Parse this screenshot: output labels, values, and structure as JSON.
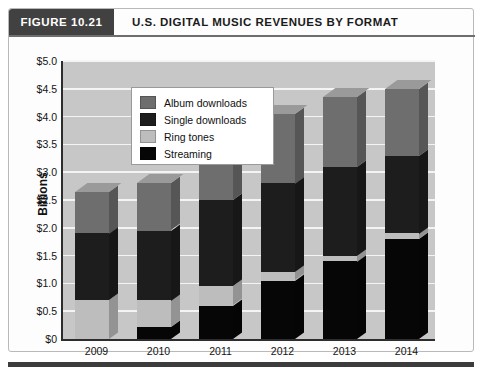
{
  "header": {
    "figure_tab": "FIGURE 10.21",
    "title": "U.S. DIGITAL MUSIC REVENUES BY FORMAT"
  },
  "footer": {
    "note": ""
  },
  "colors": {
    "album_downloads": "#6e6e6e",
    "single_downloads": "#1d1d1d",
    "ring_tones": "#bdbdbd",
    "streaming": "#060606",
    "plot_background": "#c7c7c7",
    "gridline": "#f4f4f4",
    "axis": "#2d2d2d",
    "tab_background": "#414141"
  },
  "chart_data": {
    "type": "bar",
    "subtype": "stacked-3d-column",
    "title": "U.S. DIGITAL MUSIC REVENUES BY FORMAT",
    "xlabel": "",
    "ylabel": "Billions",
    "ylim": [
      0,
      5.0
    ],
    "ytick_step": 0.5,
    "ytick_labels": [
      "$0",
      "$0.5",
      "$1.0",
      "$1.5",
      "$2.0",
      "$2.5",
      "$3.0",
      "$3.5",
      "$4.0",
      "$4.5",
      "$5.0"
    ],
    "ytick_values": [
      0,
      0.5,
      1.0,
      1.5,
      2.0,
      2.5,
      3.0,
      3.5,
      4.0,
      4.5,
      5.0
    ],
    "grid": true,
    "legend_position": "upper-left-inside",
    "categories": [
      "2009",
      "2010",
      "2011",
      "2012",
      "2013",
      "2014"
    ],
    "stack_order_bottom_to_top": [
      "Streaming",
      "Ring tones",
      "Single downloads",
      "Album downloads"
    ],
    "series": [
      {
        "name": "Streaming",
        "color": "#060606",
        "values": [
          0.0,
          0.22,
          0.6,
          1.05,
          1.4,
          1.8
        ]
      },
      {
        "name": "Ring tones",
        "color": "#bdbdbd",
        "values": [
          0.7,
          0.48,
          0.35,
          0.15,
          0.1,
          0.1
        ]
      },
      {
        "name": "Single downloads",
        "color": "#1d1d1d",
        "values": [
          1.2,
          1.25,
          1.55,
          1.6,
          1.6,
          1.4
        ]
      },
      {
        "name": "Album downloads",
        "color": "#6e6e6e",
        "values": [
          0.75,
          0.85,
          1.1,
          1.25,
          1.25,
          1.2
        ]
      }
    ],
    "totals": [
      2.65,
      2.8,
      3.6,
      4.05,
      4.35,
      4.5
    ]
  },
  "legend": {
    "items": [
      {
        "label": "Album downloads",
        "color": "#6e6e6e"
      },
      {
        "label": "Single downloads",
        "color": "#1d1d1d"
      },
      {
        "label": "Ring tones",
        "color": "#bdbdbd"
      },
      {
        "label": "Streaming",
        "color": "#060606"
      }
    ]
  }
}
